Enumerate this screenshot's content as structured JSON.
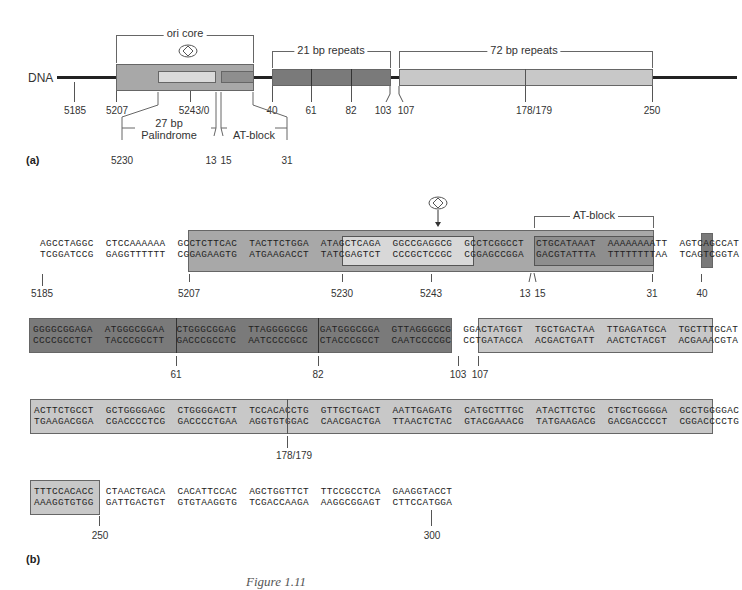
{
  "panel_a": {
    "label": "(a)",
    "dna_label": "DNA",
    "ori_core_label": "ori core",
    "repeats21_label": "21 bp repeats",
    "repeats72_label": "72 bp repeats",
    "palindrome_label_1": "27 bp",
    "palindrome_label_2": "Palindrome",
    "at_block_label": "AT-block",
    "positions": {
      "p5185": "5185",
      "p5207": "5207",
      "p5243_0": "5243/0",
      "p40": "40",
      "p61": "61",
      "p82": "82",
      "p103": "103",
      "p107": "107",
      "p178_179": "178/179",
      "p250": "250",
      "p5230": "5230",
      "p13": "13",
      "p15": "15",
      "p31": "31"
    },
    "icon": "diamond-in-oval-icon"
  },
  "panel_b": {
    "label": "(b)",
    "at_block_label": "AT-block",
    "rows": [
      {
        "top": "AGCCTAGGC  CTCCAAAAAA  GCCTCTTCAC  TACTTCTGGA  ATAGCTCAGA  GGCCGAGGCG  GCCTCGGCCT  CTGCATAAAT  AAAAAAAATT  AGTCAGCCAT",
        "bottom": "TCGGATCCG  GAGGTTTTTT  CGGAGAAGTG  ATGAAGACCT  TATCGAGTCT  CCCGCTCCGC  CGGAGCCGGA  GACGTATTTA  TTTTTTTTAA  TCAGTCGGTA",
        "positions": [
          "5185",
          "5207",
          "5230",
          "5243",
          "13",
          "15",
          "31",
          "40"
        ]
      },
      {
        "top": "GGGGCGGAGA  ATGGGCGGAA  CTGGGCGGAG  TTAGGGGCGG  GATGGGCGGA  GTTAGGGGCG  GGACTATGGT  TGCTGACTAA  TTGAGATGCA  TGCTTTGCAT",
        "bottom": "CCCCGCCTCT  TACCCGCCTT  GACCCGCCTC  AATCCCCGCC  CTACCCGCCT  CAATCCCCGC  CCTGATACCA  ACGACTGATT  AACTCTACGT  ACGAAACGTA",
        "positions": [
          "61",
          "82",
          "103",
          "107"
        ]
      },
      {
        "top": "ACTTCTGCCT  GCTGGGGAGC  CTGGGGACTT  TCCACACCTG  GTTGCTGACT  AATTGAGATG  CATGCTTTGC  ATACTTCTGC  CTGCTGGGGA  GCCTGGGGAC",
        "bottom": "TGAAGACGGA  CGACCCCTCG  GACCCCTGAA  AGGTGTGGAC  CAACGACTGA  TTAACTCTAC  GTACGAAACG  TATGAAGACG  GACGACCCCT  CGGACCCCTG",
        "positions": [
          "178/179"
        ]
      },
      {
        "top": "TTTCCACACC  CTAACTGACA  CACATTCCAC  AGCTGGTTCT  TTCCGCCTCA  GAAGGTACCT",
        "bottom": "AAAGGTGTGG  GATTGACTGT  GTGTAAGGTG  TCGACCAAGA  AAGGCGGAGT  CTTCCATGGA",
        "positions": [
          "250",
          "300"
        ]
      }
    ]
  },
  "caption": "Figure 1.11",
  "colors": {
    "ori_core": "#a8a8a8",
    "palindrome": "#d8d8d8",
    "at_block": "#8e8e8e",
    "repeats21": "#7a7a7a",
    "repeats72": "#c8c8c8",
    "dna_line": "#222222"
  }
}
